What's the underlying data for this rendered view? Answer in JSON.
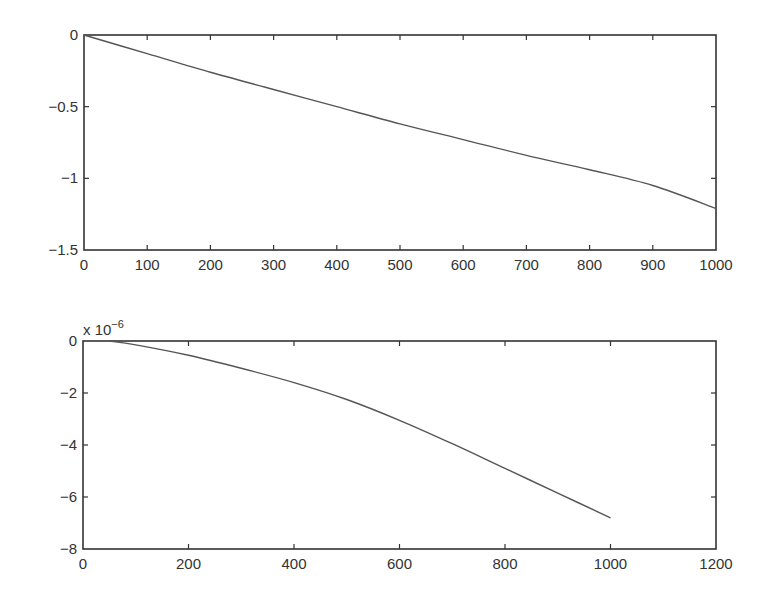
{
  "chart_data": [
    {
      "type": "line",
      "title": "",
      "xlabel": "",
      "ylabel": "",
      "xlim": [
        0,
        1000
      ],
      "ylim": [
        -1.5,
        0
      ],
      "xticks": [
        "0",
        "100",
        "200",
        "300",
        "400",
        "500",
        "600",
        "700",
        "800",
        "900",
        "1000"
      ],
      "yticks": [
        "0",
        "−0.5",
        "−1",
        "−1.5"
      ],
      "grid": false,
      "legend": null,
      "series": [
        {
          "name": "top-curve",
          "x": [
            0,
            100,
            200,
            300,
            400,
            500,
            600,
            700,
            800,
            900,
            1000
          ],
          "values": [
            0,
            -0.13,
            -0.26,
            -0.38,
            -0.5,
            -0.62,
            -0.73,
            -0.84,
            -0.94,
            -1.05,
            -1.21
          ]
        }
      ]
    },
    {
      "type": "line",
      "title": "",
      "xlabel": "",
      "ylabel": "",
      "y_scale_label": "x 10",
      "y_scale_exponent": "−6",
      "xlim": [
        0,
        1200
      ],
      "ylim": [
        -8,
        0
      ],
      "xticks": [
        "0",
        "200",
        "400",
        "600",
        "800",
        "1000",
        "1200"
      ],
      "yticks": [
        "0",
        "−2",
        "−4",
        "−6",
        "−8"
      ],
      "grid": false,
      "legend": null,
      "series": [
        {
          "name": "bottom-curve",
          "x": [
            50,
            100,
            200,
            300,
            400,
            500,
            600,
            700,
            800,
            900,
            1000
          ],
          "values": [
            0,
            -0.15,
            -0.55,
            -1.05,
            -1.6,
            -2.25,
            -3.05,
            -3.95,
            -4.9,
            -5.85,
            -6.8
          ]
        }
      ]
    }
  ]
}
